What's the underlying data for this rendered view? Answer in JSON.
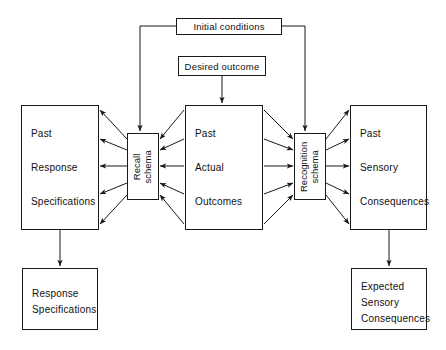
{
  "diagram": {
    "stroke_color": "#1a1a1a",
    "background_color": "#ffffff",
    "nodes": {
      "initial_conditions": {
        "label": "Initial conditions"
      },
      "desired_outcome": {
        "label": "Desired outcome"
      },
      "past_response_specifications": {
        "line1": "Past",
        "line2": "Response",
        "line3": "Specifications"
      },
      "recall_schema": {
        "line1": "Recall",
        "line2": "schema"
      },
      "past_actual_outcomes": {
        "line1": "Past",
        "line2": "Actual",
        "line3": "Outcomes"
      },
      "recognition_schema": {
        "line1": "Recognition",
        "line2": "schema"
      },
      "past_sensory_consequences": {
        "line1": "Past",
        "line2": "Sensory",
        "line3": "Consequences"
      },
      "response_specifications_output": {
        "line1": "Response",
        "line2": "Specifications"
      },
      "expected_sensory_consequences_output": {
        "line1": "Expected",
        "line2": "Sensory",
        "line3": "Consequences"
      }
    }
  }
}
